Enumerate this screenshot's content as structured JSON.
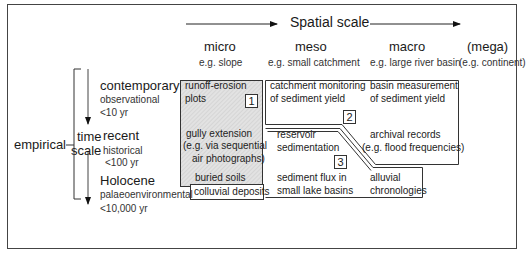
{
  "spatial": {
    "title": "Spatial scale",
    "columns": [
      {
        "label": "micro",
        "example": "e.g. slope"
      },
      {
        "label": "meso",
        "example": "e.g. small catchment"
      },
      {
        "label": "macro",
        "example": "e.g. large river basin"
      },
      {
        "label": "(mega)",
        "example": "(e.g.  continent)"
      }
    ]
  },
  "time": {
    "approach": "empirical",
    "axis_label_1": "time",
    "axis_label_2": "scale",
    "rows": [
      {
        "label": "contemporary",
        "type": "observational",
        "range": "<10 yr"
      },
      {
        "label": "recent",
        "type": "historical",
        "range": "<100 yr"
      },
      {
        "label": "Holocene",
        "type": "palaeoenvironmental",
        "range": "<10,000 yr"
      }
    ]
  },
  "zones": {
    "z1": {
      "number": "1",
      "items": [
        "runoff-erosion",
        "plots",
        "gully extension",
        "(e.g. via sequential",
        "air photographs)",
        "buried soils",
        "colluvial deposits"
      ]
    },
    "z2": {
      "number": "2",
      "items": [
        "catchment monitoring",
        "of sediment yield",
        "basin measurement",
        "of sediment yield",
        "archival records",
        "(e.g. flood frequencies)"
      ]
    },
    "z3": {
      "number": "3",
      "items": [
        "reservoir",
        "sedimentation",
        "sediment flux in",
        "small lake basins",
        "alluvial",
        "chronologies"
      ]
    }
  },
  "colors": {
    "frame": "#333333",
    "shade": "#dcdcdc",
    "line": "#222222"
  }
}
